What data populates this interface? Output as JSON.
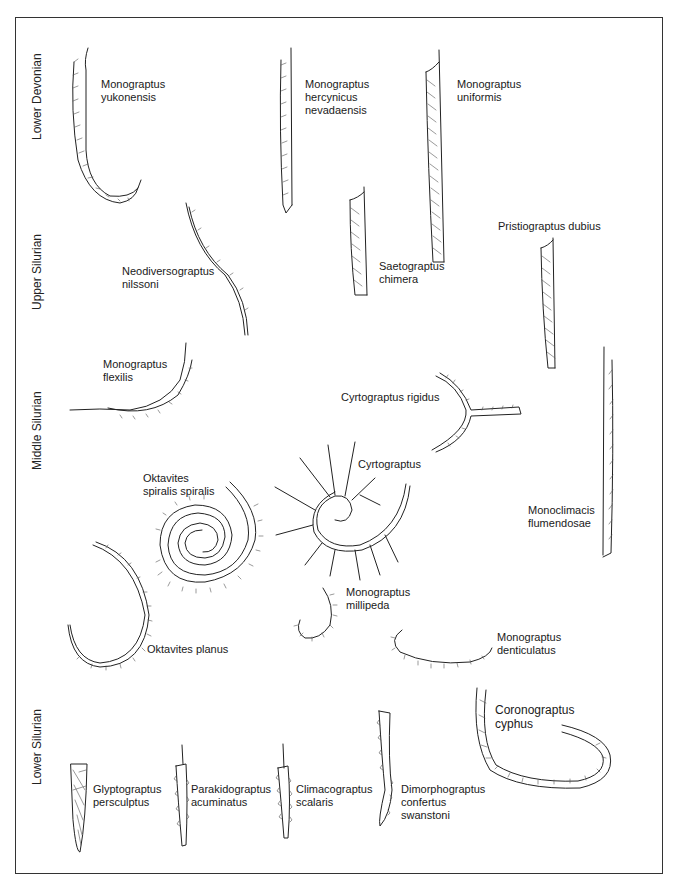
{
  "figure": {
    "type": "paleontology-plate"
  },
  "periods": [
    {
      "id": "lower-devonian",
      "label": "Lower Devonian"
    },
    {
      "id": "upper-silurian",
      "label": "Upper Silurian"
    },
    {
      "id": "middle-silurian",
      "label": "Middle Silurian"
    },
    {
      "id": "lower-silurian",
      "label": "Lower Silurian"
    }
  ],
  "species": [
    {
      "id": "monograptus-yukonensis",
      "lines": [
        "Monograptus",
        "yukonensis"
      ]
    },
    {
      "id": "monograptus-hercynicus-nevadaensis",
      "lines": [
        "Monograptus",
        "hercynicus",
        "nevadaensis"
      ]
    },
    {
      "id": "monograptus-uniformis",
      "lines": [
        "Monograptus",
        "uniformis"
      ]
    },
    {
      "id": "neodiversograptus-nilssoni",
      "lines": [
        "Neodiversograptus",
        "nilssoni"
      ]
    },
    {
      "id": "saetograptus-chimera",
      "lines": [
        "Saetograptus",
        "chimera"
      ]
    },
    {
      "id": "pristiograptus-dubius",
      "lines": [
        "Pristiograptus dubius"
      ]
    },
    {
      "id": "monograptus-flexilis",
      "lines": [
        "Monograptus",
        "flexilis"
      ]
    },
    {
      "id": "cyrtograptus-rigidus",
      "lines": [
        "Cyrtograptus rigidus"
      ]
    },
    {
      "id": "cyrtograptus",
      "lines": [
        "Cyrtograptus"
      ]
    },
    {
      "id": "oktavites-spiralis-spiralis",
      "lines": [
        "Oktavites",
        "spiralis spiralis"
      ]
    },
    {
      "id": "monoclimacis-flumendosae",
      "lines": [
        "Monoclimacis",
        "flumendosae"
      ]
    },
    {
      "id": "oktavites-planus",
      "lines": [
        "Oktavites planus"
      ]
    },
    {
      "id": "monograptus-millipeda",
      "lines": [
        "Monograptus",
        "millipeda"
      ]
    },
    {
      "id": "monograptus-denticulatus",
      "lines": [
        "Monograptus",
        "denticulatus"
      ]
    },
    {
      "id": "coronograptus-cyphus",
      "lines": [
        "Coronograptus",
        "cyphus"
      ]
    },
    {
      "id": "glyptograptus-persculptus",
      "lines": [
        "Glyptograptus",
        "persculptus"
      ]
    },
    {
      "id": "parakidograptus-acuminatus",
      "lines": [
        "Parakidograptus",
        "acuminatus"
      ]
    },
    {
      "id": "climacograptus-scalaris",
      "lines": [
        "Climacograptus",
        "scalaris"
      ]
    },
    {
      "id": "dimorphograptus-confertus-swanstoni",
      "lines": [
        "Dimorphograptus",
        "confertus",
        "swanstoni"
      ]
    }
  ],
  "colors": {
    "ink": "#222222",
    "background": "#ffffff",
    "border": "#333333"
  }
}
